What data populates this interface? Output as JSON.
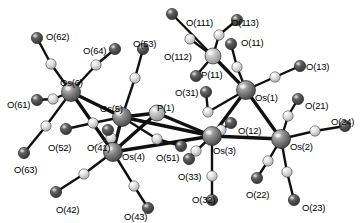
{
  "figure": {
    "kind": "molecular-structure-diagram",
    "width": 363,
    "height": 223,
    "background": "#ffffff"
  },
  "palette": {
    "osmium": "#6e6e6e",
    "osmium_highlight": "#cfcfcf",
    "phosphorus": "#b4b4b4",
    "phosphorus_highlight": "#ededed",
    "oxygen": "#4a4a4a",
    "oxygen_highlight": "#b9b9b9",
    "carbon": "#dcdcdc",
    "carbon_highlight": "#fbfbfb",
    "bond": "#101010",
    "label": "#000000"
  },
  "radii": {
    "osmium": 9.5,
    "phosphorus": 8.0,
    "oxygen": 5.6,
    "carbon": 5.2
  },
  "atoms": [
    {
      "id": "Os1",
      "element": "Os",
      "label": "Os(1)",
      "x": 246,
      "y": 90,
      "label_x": 255,
      "label_y": 93
    },
    {
      "id": "Os2",
      "element": "Os",
      "label": "Os(2)",
      "x": 281,
      "y": 139,
      "label_x": 290,
      "label_y": 142
    },
    {
      "id": "Os3",
      "element": "Os",
      "label": "Os(3)",
      "x": 212,
      "y": 136,
      "label_x": 213,
      "label_y": 146
    },
    {
      "id": "Os4",
      "element": "Os",
      "label": "Os(4)",
      "x": 113,
      "y": 152,
      "label_x": 122,
      "label_y": 152
    },
    {
      "id": "Os5",
      "element": "Os",
      "label": "Os(5)",
      "x": 122,
      "y": 117,
      "label_x": 100,
      "label_y": 104
    },
    {
      "id": "Os6",
      "element": "Os",
      "label": "Os(6)",
      "x": 71,
      "y": 92,
      "label_x": 60,
      "label_y": 78
    },
    {
      "id": "P1",
      "element": "P",
      "label": "P(1)",
      "x": 157,
      "y": 113,
      "label_x": 157,
      "label_y": 103
    },
    {
      "id": "P11",
      "element": "P",
      "label": "P(11)",
      "x": 213,
      "y": 56,
      "label_x": 201,
      "label_y": 70
    },
    {
      "id": "O11",
      "element": "O",
      "label": "O(11)",
      "x": 231,
      "y": 44,
      "label_x": 241,
      "label_y": 38
    },
    {
      "id": "O12",
      "element": "O",
      "label": "O(12)",
      "x": 231,
      "y": 123,
      "label_x": 238,
      "label_y": 126
    },
    {
      "id": "O13",
      "element": "O",
      "label": "O(13)",
      "x": 300,
      "y": 66,
      "label_x": 306,
      "label_y": 62
    },
    {
      "id": "O21",
      "element": "O",
      "label": "O(21)",
      "x": 298,
      "y": 99,
      "label_x": 305,
      "label_y": 101
    },
    {
      "id": "O22",
      "element": "O",
      "label": "O(22)",
      "x": 257,
      "y": 178,
      "label_x": 246,
      "label_y": 190
    },
    {
      "id": "O23",
      "element": "O",
      "label": "O(23)",
      "x": 294,
      "y": 200,
      "label_x": 302,
      "label_y": 203
    },
    {
      "id": "O24",
      "element": "O",
      "label": "O(24)",
      "x": 345,
      "y": 126,
      "label_x": 331,
      "label_y": 117
    },
    {
      "id": "O31",
      "element": "O",
      "label": "O(31)",
      "x": 206,
      "y": 92,
      "label_x": 175,
      "label_y": 88
    },
    {
      "id": "O32",
      "element": "O",
      "label": "O(32)",
      "x": 212,
      "y": 200,
      "label_x": 192,
      "label_y": 195
    },
    {
      "id": "O33",
      "element": "O",
      "label": "O(33)",
      "x": 189,
      "y": 159,
      "label_x": 178,
      "label_y": 172
    },
    {
      "id": "O41",
      "element": "O",
      "label": "O(41)",
      "x": 108,
      "y": 130,
      "label_x": 87,
      "label_y": 143
    },
    {
      "id": "O42",
      "element": "O",
      "label": "O(42)",
      "x": 56,
      "y": 192,
      "label_x": 56,
      "label_y": 205
    },
    {
      "id": "O43",
      "element": "O",
      "label": "O(43)",
      "x": 148,
      "y": 208,
      "label_x": 124,
      "label_y": 212
    },
    {
      "id": "O51",
      "element": "O",
      "label": "O(51)",
      "x": 181,
      "y": 146,
      "label_x": 156,
      "label_y": 153
    },
    {
      "id": "O52",
      "element": "O",
      "label": "O(52)",
      "x": 66,
      "y": 129,
      "label_x": 48,
      "label_y": 143
    },
    {
      "id": "O53",
      "element": "O",
      "label": "O(53)",
      "x": 143,
      "y": 49,
      "label_x": 133,
      "label_y": 39
    },
    {
      "id": "O61",
      "element": "O",
      "label": "O(61)",
      "x": 37,
      "y": 100,
      "label_x": 7,
      "label_y": 100
    },
    {
      "id": "O62",
      "element": "O",
      "label": "O(62)",
      "x": 37,
      "y": 38,
      "label_x": 46,
      "label_y": 32
    },
    {
      "id": "O63",
      "element": "O",
      "label": "O(63)",
      "x": 24,
      "y": 153,
      "label_x": 14,
      "label_y": 165
    },
    {
      "id": "O64",
      "element": "O",
      "label": "O(64)",
      "x": 115,
      "y": 49,
      "label_x": 83,
      "label_y": 46
    },
    {
      "id": "O111",
      "element": "O",
      "label": "O(111)",
      "x": 172,
      "y": 14,
      "label_x": 186,
      "label_y": 18
    },
    {
      "id": "O112",
      "element": "O",
      "label": "O(112)",
      "x": 196,
      "y": 76,
      "label_x": 164,
      "label_y": 52
    },
    {
      "id": "O113",
      "element": "O",
      "label": "O(113)",
      "x": 237,
      "y": 20,
      "label_x": 231,
      "label_y": 18
    },
    {
      "id": "C11",
      "element": "C",
      "x": 237,
      "y": 67
    },
    {
      "id": "C12",
      "element": "C",
      "x": 221,
      "y": 130
    },
    {
      "id": "C13",
      "element": "C",
      "x": 275,
      "y": 77
    },
    {
      "id": "C21",
      "element": "C",
      "x": 288,
      "y": 116
    },
    {
      "id": "C22",
      "element": "C",
      "x": 268,
      "y": 161
    },
    {
      "id": "C23",
      "element": "C",
      "x": 287,
      "y": 172
    },
    {
      "id": "C24",
      "element": "C",
      "x": 315,
      "y": 131
    },
    {
      "id": "C31",
      "element": "C",
      "x": 208,
      "y": 112
    },
    {
      "id": "C32",
      "element": "C",
      "x": 212,
      "y": 176
    },
    {
      "id": "C33",
      "element": "C",
      "x": 196,
      "y": 151
    },
    {
      "id": "C41",
      "element": "C",
      "x": 111,
      "y": 138
    },
    {
      "id": "C42",
      "element": "C",
      "x": 84,
      "y": 174
    },
    {
      "id": "C43",
      "element": "C",
      "x": 134,
      "y": 186
    },
    {
      "id": "C51",
      "element": "C",
      "x": 157,
      "y": 139
    },
    {
      "id": "C52",
      "element": "C",
      "x": 93,
      "y": 123
    },
    {
      "id": "C53",
      "element": "C",
      "x": 135,
      "y": 78
    },
    {
      "id": "C61",
      "element": "C",
      "x": 53,
      "y": 99
    },
    {
      "id": "C62",
      "element": "C",
      "x": 51,
      "y": 64
    },
    {
      "id": "C63",
      "element": "C",
      "x": 46,
      "y": 126
    },
    {
      "id": "C64",
      "element": "C",
      "x": 96,
      "y": 65
    },
    {
      "id": "C111",
      "element": "C",
      "x": 190,
      "y": 39
    },
    {
      "id": "C113",
      "element": "C",
      "x": 219,
      "y": 35
    }
  ],
  "bonds": [
    {
      "from": "Os1",
      "to": "Os2"
    },
    {
      "from": "Os1",
      "to": "Os3"
    },
    {
      "from": "Os2",
      "to": "Os3"
    },
    {
      "from": "Os3",
      "to": "Os5"
    },
    {
      "from": "Os3",
      "to": "Os4"
    },
    {
      "from": "Os4",
      "to": "Os5"
    },
    {
      "from": "Os5",
      "to": "Os6"
    },
    {
      "from": "Os4",
      "to": "Os6"
    },
    {
      "from": "Os1",
      "to": "P11"
    },
    {
      "from": "Os3",
      "to": "P1"
    },
    {
      "from": "Os5",
      "to": "P1"
    },
    {
      "from": "Os4",
      "to": "P1"
    },
    {
      "from": "P11",
      "to": "O111"
    },
    {
      "from": "P11",
      "to": "C111"
    },
    {
      "from": "P11",
      "to": "C113"
    },
    {
      "from": "C113",
      "to": "O113"
    },
    {
      "from": "P11",
      "to": "O112"
    },
    {
      "from": "Os1",
      "to": "C11"
    },
    {
      "from": "C11",
      "to": "O11"
    },
    {
      "from": "Os1",
      "to": "C13"
    },
    {
      "from": "C13",
      "to": "O13"
    },
    {
      "from": "Os1",
      "to": "C31"
    },
    {
      "from": "C31",
      "to": "O31"
    },
    {
      "from": "Os2",
      "to": "C21"
    },
    {
      "from": "C21",
      "to": "O21"
    },
    {
      "from": "Os2",
      "to": "C22"
    },
    {
      "from": "C22",
      "to": "O22"
    },
    {
      "from": "Os2",
      "to": "C23"
    },
    {
      "from": "C23",
      "to": "O23"
    },
    {
      "from": "Os2",
      "to": "C24"
    },
    {
      "from": "C24",
      "to": "O24"
    },
    {
      "from": "Os3",
      "to": "C12"
    },
    {
      "from": "C12",
      "to": "O12"
    },
    {
      "from": "Os3",
      "to": "C32"
    },
    {
      "from": "C32",
      "to": "O32"
    },
    {
      "from": "Os3",
      "to": "C33"
    },
    {
      "from": "C33",
      "to": "O33"
    },
    {
      "from": "Os4",
      "to": "C41"
    },
    {
      "from": "C41",
      "to": "O41"
    },
    {
      "from": "Os4",
      "to": "C42"
    },
    {
      "from": "C42",
      "to": "O42"
    },
    {
      "from": "Os4",
      "to": "C43"
    },
    {
      "from": "C43",
      "to": "O43"
    },
    {
      "from": "Os5",
      "to": "C51"
    },
    {
      "from": "C51",
      "to": "O51"
    },
    {
      "from": "Os5",
      "to": "C52"
    },
    {
      "from": "C52",
      "to": "O52"
    },
    {
      "from": "Os5",
      "to": "C53"
    },
    {
      "from": "C53",
      "to": "O53"
    },
    {
      "from": "Os6",
      "to": "C61"
    },
    {
      "from": "C61",
      "to": "O61"
    },
    {
      "from": "Os6",
      "to": "C62"
    },
    {
      "from": "C62",
      "to": "O62"
    },
    {
      "from": "Os6",
      "to": "C63"
    },
    {
      "from": "C63",
      "to": "O63"
    },
    {
      "from": "Os6",
      "to": "C64"
    },
    {
      "from": "C64",
      "to": "O64"
    }
  ],
  "leader_lines": [
    {
      "name": "o41-leader",
      "x1": 106,
      "y1": 140,
      "x2": 92,
      "y2": 148
    }
  ]
}
